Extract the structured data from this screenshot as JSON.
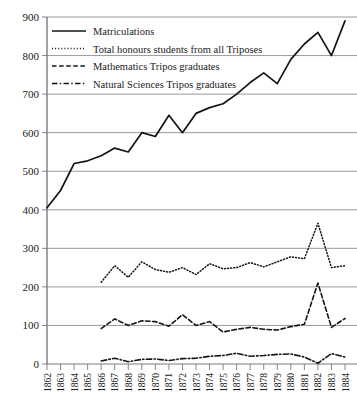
{
  "chart_data": {
    "type": "line",
    "title": "",
    "xlabel": "",
    "ylabel": "",
    "ylim": [
      0,
      900
    ],
    "yticks": [
      0,
      100,
      200,
      300,
      400,
      500,
      600,
      700,
      800,
      900
    ],
    "grid": true,
    "legend_position": "top-left",
    "categories": [
      "1862",
      "1863",
      "1864",
      "1865",
      "1866",
      "1867",
      "1868",
      "1869",
      "1870",
      "1871",
      "1872",
      "1873",
      "1874",
      "1875",
      "1876",
      "1877",
      "1878",
      "1879",
      "1880",
      "1881",
      "1882",
      "1883",
      "1884"
    ],
    "series": [
      {
        "name": "Matriculations",
        "style": "solid",
        "x": [
          "1862",
          "1863",
          "1864",
          "1865",
          "1866",
          "1867",
          "1868",
          "1869",
          "1870",
          "1871",
          "1872",
          "1873",
          "1874",
          "1875",
          "1876",
          "1877",
          "1878",
          "1879",
          "1880",
          "1881",
          "1882",
          "1883",
          "1884"
        ],
        "values": [
          405,
          450,
          520,
          527,
          540,
          560,
          550,
          600,
          590,
          645,
          600,
          650,
          665,
          675,
          700,
          730,
          755,
          727,
          790,
          830,
          860,
          800,
          890
        ]
      },
      {
        "name": "Total honours students from all Triposes",
        "style": "dotted",
        "x": [
          "1866",
          "1867",
          "1868",
          "1869",
          "1870",
          "1871",
          "1872",
          "1873",
          "1874",
          "1875",
          "1876",
          "1877",
          "1878",
          "1879",
          "1880",
          "1881",
          "1882",
          "1883",
          "1884"
        ],
        "values": [
          212,
          255,
          225,
          265,
          245,
          238,
          250,
          232,
          260,
          247,
          250,
          263,
          252,
          265,
          278,
          273,
          365,
          250,
          255
        ]
      },
      {
        "name": "Mathematics Tripos graduates",
        "style": "dashed",
        "x": [
          "1866",
          "1867",
          "1868",
          "1869",
          "1870",
          "1871",
          "1872",
          "1873",
          "1874",
          "1875",
          "1876",
          "1877",
          "1878",
          "1879",
          "1880",
          "1881",
          "1882",
          "1883",
          "1884"
        ],
        "values": [
          92,
          117,
          100,
          112,
          110,
          98,
          128,
          100,
          110,
          83,
          90,
          95,
          90,
          88,
          97,
          103,
          210,
          95,
          118
        ]
      },
      {
        "name": "Natural Sciences Tripos graduates",
        "style": "dash-dot",
        "x": [
          "1866",
          "1867",
          "1868",
          "1869",
          "1870",
          "1871",
          "1872",
          "1873",
          "1874",
          "1875",
          "1876",
          "1877",
          "1878",
          "1879",
          "1880",
          "1881",
          "1882",
          "1883",
          "1884"
        ],
        "values": [
          8,
          15,
          6,
          12,
          13,
          9,
          14,
          15,
          20,
          22,
          28,
          20,
          22,
          25,
          26,
          18,
          2,
          27,
          18
        ]
      }
    ]
  },
  "legend": {
    "items": [
      {
        "label": "Matriculations",
        "style": "solid"
      },
      {
        "label": "Total honours students from all Triposes",
        "style": "dotted"
      },
      {
        "label": "Mathematics Tripos graduates",
        "style": "dashed"
      },
      {
        "label": "Natural Sciences Tripos graduates",
        "style": "dash-dot"
      }
    ]
  },
  "colors": {
    "line": "#141414",
    "grid": "#8f8f8f",
    "axis": "#7a7a7a",
    "background": "#ffffff",
    "text": "#1a1a1a"
  }
}
